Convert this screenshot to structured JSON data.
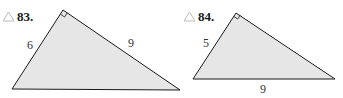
{
  "problems": [
    {
      "number_label": "83.",
      "icon": "triangle-icon",
      "right_angle_at": "top vertex",
      "sides": [
        {
          "label": "6",
          "position": "left leg"
        },
        {
          "label": "9",
          "position": "right leg"
        }
      ]
    },
    {
      "number_label": "84.",
      "icon": "triangle-icon",
      "right_angle_at": "top vertex",
      "sides": [
        {
          "label": "5",
          "position": "left leg"
        },
        {
          "label": "9",
          "position": "hypotenuse (bottom)"
        }
      ]
    }
  ],
  "colors": {
    "fill": "#e6e6e6",
    "stroke": "#1a1a1a",
    "icon": "#b5b5b5"
  }
}
